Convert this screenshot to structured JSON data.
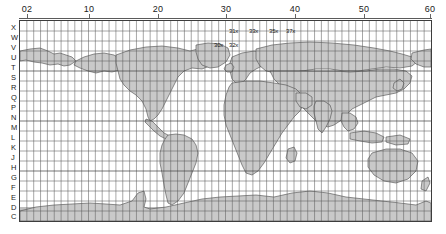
{
  "figure": {
    "background_color": "#ffffff",
    "frame_color": "#3d3d3d",
    "land_fill_color": "#c9c9c9",
    "land_stroke_color": "#4a4a4a",
    "grid_color": "#5e5e5e"
  },
  "top_axis": {
    "label": "UTM zone number",
    "ticks": [
      {
        "value": "02",
        "x_px": 27
      },
      {
        "value": "10",
        "x_px": 89
      },
      {
        "value": "20",
        "x_px": 158
      },
      {
        "value": "30",
        "x_px": 226
      },
      {
        "value": "40",
        "x_px": 295
      },
      {
        "value": "50",
        "x_px": 364
      },
      {
        "value": "60",
        "x_px": 430
      }
    ]
  },
  "left_axis": {
    "label": "UTM latitude band letter",
    "bands": [
      {
        "letter": "X",
        "y_px": 24
      },
      {
        "letter": "W",
        "y_px": 34
      },
      {
        "letter": "V",
        "y_px": 44
      },
      {
        "letter": "U",
        "y_px": 54
      },
      {
        "letter": "T",
        "y_px": 64
      },
      {
        "letter": "S",
        "y_px": 74
      },
      {
        "letter": "R",
        "y_px": 84
      },
      {
        "letter": "Q",
        "y_px": 94
      },
      {
        "letter": "P",
        "y_px": 104
      },
      {
        "letter": "N",
        "y_px": 114
      },
      {
        "letter": "M",
        "y_px": 124
      },
      {
        "letter": "L",
        "y_px": 134
      },
      {
        "letter": "K",
        "y_px": 144
      },
      {
        "letter": "J",
        "y_px": 154
      },
      {
        "letter": "H",
        "y_px": 164
      },
      {
        "letter": "G",
        "y_px": 174
      },
      {
        "letter": "F",
        "y_px": 184
      },
      {
        "letter": "E",
        "y_px": 194
      },
      {
        "letter": "D",
        "y_px": 204
      },
      {
        "letter": "C",
        "y_px": 213
      }
    ]
  },
  "zone_callouts": [
    {
      "text": "31x",
      "x_px": 228,
      "y_px": 27
    },
    {
      "text": "33x",
      "x_px": 248,
      "y_px": 27
    },
    {
      "text": "35x",
      "x_px": 268,
      "y_px": 27
    },
    {
      "text": "37x",
      "x_px": 285,
      "y_px": 27
    },
    {
      "text": "30x",
      "x_px": 213,
      "y_px": 41
    },
    {
      "text": "32x",
      "x_px": 228,
      "y_px": 41
    }
  ],
  "grid": {
    "columns": 60,
    "rows": 20,
    "show_grid": true,
    "cell_width_px": 6.85,
    "cell_height_px": 10.0
  },
  "map_frame": {
    "left_px": 19,
    "top_px": 20,
    "width_px": 413,
    "height_px": 202
  }
}
